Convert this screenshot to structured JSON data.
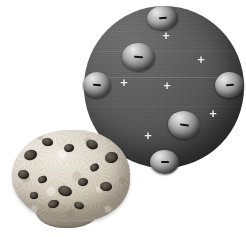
{
  "figure": {
    "background_color": "#ffffff",
    "width": 246,
    "height": 237
  },
  "atom": {
    "name": "plum-pudding-atom",
    "sphere_color": "#555555",
    "sphere_highlight_color": "#6e6e6e",
    "sphere_shadow_color": "#242424",
    "electron_symbol": "−",
    "positive_symbol": "+",
    "positive_color": "#f2f2ee",
    "electron_count": 6,
    "positive_count": 6,
    "electrons": [
      {
        "label": "electron-top",
        "symbol": "−",
        "left": 63,
        "top": 0,
        "w": 31,
        "h": 24,
        "minus_w": 8,
        "minus_h": 2,
        "rot": -4
      },
      {
        "label": "electron-upper-left",
        "symbol": "−",
        "left": 38,
        "top": 37,
        "w": 33,
        "h": 28,
        "minus_w": 9,
        "minus_h": 2,
        "rot": 6
      },
      {
        "label": "electron-left",
        "symbol": "−",
        "left": -1,
        "top": 66,
        "w": 28,
        "h": 26,
        "minus_w": 8,
        "minus_h": 2,
        "rot": 4
      },
      {
        "label": "electron-right",
        "symbol": "−",
        "left": 131,
        "top": 66,
        "w": 29,
        "h": 26,
        "minus_w": 8,
        "minus_h": 2,
        "rot": -6
      },
      {
        "label": "electron-lower-right",
        "symbol": "−",
        "left": 84,
        "top": 105,
        "w": 32,
        "h": 28,
        "minus_w": 9,
        "minus_h": 2,
        "rot": 8
      },
      {
        "label": "electron-bottom",
        "symbol": "−",
        "left": 66,
        "top": 144,
        "w": 29,
        "h": 24,
        "minus_w": 8,
        "minus_h": 2,
        "rot": 2
      }
    ],
    "positives": [
      {
        "label": "positive-top",
        "symbol": "+",
        "left": 82,
        "top": 29,
        "size": 13
      },
      {
        "label": "positive-upper-right",
        "symbol": "+",
        "left": 117,
        "top": 53,
        "size": 13
      },
      {
        "label": "positive-left",
        "symbol": "+",
        "left": 40,
        "top": 76,
        "size": 13
      },
      {
        "label": "positive-center",
        "symbol": "+",
        "left": 83,
        "top": 79,
        "size": 13
      },
      {
        "label": "positive-right",
        "symbol": "+",
        "left": 129,
        "top": 107,
        "size": 13
      },
      {
        "label": "positive-bottom",
        "symbol": "+",
        "left": 64,
        "top": 129,
        "size": 13
      }
    ]
  },
  "muffin": {
    "name": "chip-muffin-photo",
    "crumb_color": "#e2dccf",
    "chip_color": "#3a342c",
    "chips": [
      {
        "left": 12,
        "top": 20,
        "w": 13,
        "h": 10,
        "rot": -18
      },
      {
        "left": 30,
        "top": 8,
        "w": 11,
        "h": 8,
        "rot": 12
      },
      {
        "left": 52,
        "top": 14,
        "w": 10,
        "h": 8,
        "rot": -6
      },
      {
        "left": 74,
        "top": 10,
        "w": 12,
        "h": 9,
        "rot": 22
      },
      {
        "left": 93,
        "top": 22,
        "w": 13,
        "h": 11,
        "rot": -12
      },
      {
        "left": 6,
        "top": 40,
        "w": 11,
        "h": 9,
        "rot": 8
      },
      {
        "left": 26,
        "top": 46,
        "w": 9,
        "h": 7,
        "rot": -20
      },
      {
        "left": 46,
        "top": 56,
        "w": 14,
        "h": 10,
        "rot": 16
      },
      {
        "left": 66,
        "top": 48,
        "w": 10,
        "h": 8,
        "rot": -9
      },
      {
        "left": 88,
        "top": 52,
        "w": 12,
        "h": 9,
        "rot": 5
      },
      {
        "left": 36,
        "top": 70,
        "w": 11,
        "h": 8,
        "rot": -14
      },
      {
        "left": 62,
        "top": 72,
        "w": 10,
        "h": 7,
        "rot": 18
      },
      {
        "left": 18,
        "top": 62,
        "w": 8,
        "h": 7,
        "rot": 3
      },
      {
        "left": 78,
        "top": 34,
        "w": 9,
        "h": 7,
        "rot": -25
      }
    ]
  }
}
